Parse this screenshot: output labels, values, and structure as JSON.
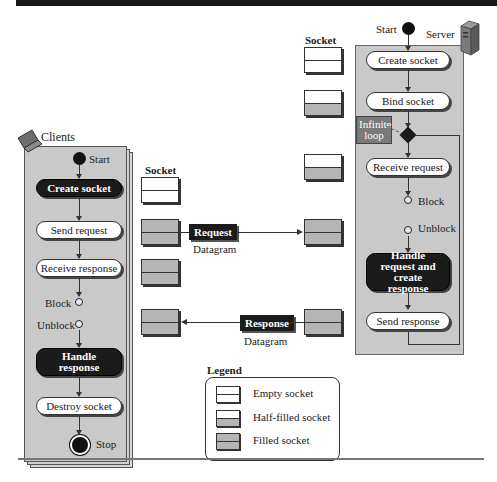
{
  "figure": {
    "top_caption_cut": "Figure ... UDP client-server paradigm"
  },
  "clients": {
    "title": "Clients",
    "icon": "laptop-icon",
    "start_label": "Start",
    "stop_label": "Stop",
    "steps": [
      "Create socket",
      "Send request",
      "Receive response",
      "Handle response",
      "Destroy socket"
    ],
    "block_label": "Block",
    "unblock_label": "Unblock",
    "socket_heading": "Socket",
    "sockets": [
      "empty",
      "filled",
      "filled",
      "filled"
    ]
  },
  "server": {
    "title": "Server",
    "icon": "server-icon",
    "start_label": "Start",
    "steps": [
      "Create socket",
      "Bind socket",
      "Receive request",
      "Handle request and create response",
      "Send response"
    ],
    "block_label": "Block",
    "unblock_label": "Unblock",
    "loop_note": "Infinite loop",
    "socket_heading": "Socket",
    "sockets": [
      "empty",
      "half-filled",
      "half-filled",
      "filled",
      "filled"
    ]
  },
  "datagrams": [
    {
      "label": "Request",
      "sublabel": "Datagram",
      "direction": "client-to-server"
    },
    {
      "label": "Response",
      "sublabel": "Datagram",
      "direction": "server-to-client"
    }
  ],
  "legend": {
    "title": "Legend",
    "items": [
      {
        "type": "empty",
        "label": "Empty socket"
      },
      {
        "type": "half-filled",
        "label": "Half-filled socket"
      },
      {
        "type": "filled",
        "label": "Filled socket"
      }
    ]
  },
  "colors": {
    "panel": "#c9c9c9",
    "dark_node": "#1b1b1b",
    "socket_fill": "#b5b5b5",
    "note": "#7a7a7a"
  }
}
